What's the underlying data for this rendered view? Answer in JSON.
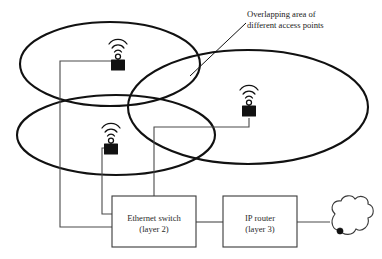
{
  "diagram": {
    "annotation": {
      "line1": "Overlapping area of",
      "line2": "different access points"
    },
    "nodes": {
      "ethernet_switch": {
        "line1": "Ethernet switch",
        "line2": "(layer 2)"
      },
      "ip_router": {
        "line1": "IP router",
        "line2": "(layer 3)"
      },
      "cloud": {
        "label": ""
      }
    },
    "access_points": [
      {
        "id": "ap-top-left",
        "icon": "wireless-access-point-icon"
      },
      {
        "id": "ap-right",
        "icon": "wireless-access-point-icon"
      },
      {
        "id": "ap-bottom-left",
        "icon": "wireless-access-point-icon"
      }
    ],
    "coverage_cells": [
      {
        "id": "cell-top-left"
      },
      {
        "id": "cell-right"
      },
      {
        "id": "cell-bottom-left"
      }
    ],
    "colors": {
      "ellipse_stroke": "#111111",
      "box_stroke": "#3a3a3a",
      "link_stroke": "#4a4a4a",
      "device_fill": "#111111",
      "background": "#ffffff",
      "text": "#1b1b1b"
    }
  }
}
